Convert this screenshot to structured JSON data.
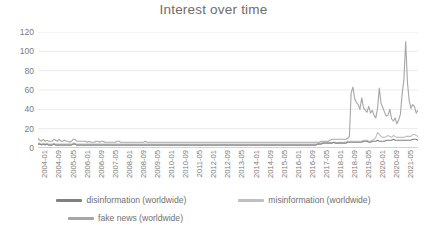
{
  "chart_data": {
    "type": "line",
    "title": "Interest over time",
    "xlabel": "",
    "ylabel": "",
    "ylim": [
      0,
      120
    ],
    "yticks": [
      0,
      20,
      40,
      60,
      80,
      100,
      120
    ],
    "grid": true,
    "legend_position": "bottom",
    "x_tick_labels": [
      "2004-01",
      "2004-09",
      "2005-05",
      "2006-01",
      "2006-09",
      "2007-05",
      "2008-01",
      "2008-09",
      "2009-05",
      "2010-01",
      "2010-09",
      "2011-05",
      "2012-01",
      "2012-09",
      "2013-05",
      "2014-01",
      "2014-09",
      "2015-05",
      "2016-01",
      "2016-09",
      "2017-05",
      "2018-01",
      "2018-09",
      "2019-05",
      "2020-01",
      "2020-09",
      "2021-05"
    ],
    "x_tick_step_months": 8,
    "x_start": "2004-01",
    "x_end": "2021-09",
    "n_points": 213,
    "series": [
      {
        "name": "disinformation (worldwide)",
        "color": "#808080",
        "values": [
          4,
          4,
          3,
          4,
          3,
          4,
          3,
          3,
          3,
          4,
          3,
          3,
          3,
          3,
          3,
          3,
          3,
          3,
          3,
          3,
          4,
          4,
          3,
          3,
          3,
          3,
          3,
          3,
          3,
          3,
          3,
          3,
          3,
          3,
          3,
          3,
          3,
          3,
          3,
          3,
          3,
          3,
          3,
          3,
          3,
          3,
          3,
          3,
          3,
          3,
          3,
          3,
          3,
          3,
          3,
          3,
          3,
          3,
          3,
          3,
          3,
          3,
          3,
          3,
          3,
          3,
          3,
          3,
          3,
          3,
          3,
          3,
          3,
          3,
          3,
          3,
          3,
          3,
          3,
          3,
          3,
          3,
          3,
          3,
          3,
          3,
          3,
          3,
          3,
          3,
          3,
          3,
          3,
          3,
          3,
          3,
          3,
          3,
          3,
          3,
          3,
          3,
          3,
          3,
          3,
          3,
          3,
          3,
          3,
          3,
          3,
          3,
          3,
          3,
          3,
          3,
          3,
          3,
          3,
          3,
          3,
          3,
          3,
          3,
          3,
          3,
          3,
          3,
          3,
          3,
          3,
          3,
          3,
          3,
          3,
          3,
          3,
          3,
          3,
          3,
          3,
          3,
          3,
          3,
          3,
          3,
          3,
          3,
          3,
          3,
          3,
          3,
          3,
          3,
          3,
          3,
          3,
          3,
          3,
          4,
          4,
          4,
          5,
          5,
          5,
          5,
          5,
          5,
          6,
          5,
          5,
          5,
          5,
          5,
          5,
          5,
          6,
          6,
          6,
          6,
          6,
          6,
          6,
          6,
          6,
          7,
          7,
          7,
          6,
          6,
          7,
          7,
          7,
          8,
          7,
          7,
          7,
          7,
          8,
          8,
          8,
          8,
          9,
          8,
          8,
          8,
          8,
          8,
          8,
          8,
          8,
          8,
          8,
          9,
          9,
          9,
          8
        ]
      },
      {
        "name": "misinformation (worldwide)",
        "color": "#bfbfbf",
        "values": [
          5,
          5,
          4,
          5,
          4,
          5,
          4,
          4,
          4,
          5,
          4,
          4,
          4,
          4,
          4,
          4,
          4,
          4,
          4,
          4,
          5,
          5,
          4,
          4,
          4,
          4,
          4,
          4,
          4,
          4,
          4,
          4,
          4,
          4,
          4,
          4,
          4,
          4,
          4,
          4,
          4,
          4,
          4,
          4,
          4,
          4,
          4,
          4,
          4,
          4,
          4,
          4,
          4,
          4,
          4,
          4,
          4,
          4,
          4,
          4,
          4,
          4,
          4,
          4,
          4,
          4,
          4,
          4,
          4,
          4,
          4,
          4,
          4,
          4,
          4,
          4,
          4,
          4,
          4,
          4,
          4,
          4,
          4,
          4,
          4,
          4,
          4,
          4,
          4,
          4,
          4,
          4,
          4,
          4,
          4,
          4,
          4,
          4,
          4,
          4,
          4,
          4,
          4,
          4,
          4,
          4,
          4,
          4,
          4,
          4,
          4,
          4,
          4,
          4,
          4,
          4,
          4,
          4,
          4,
          4,
          4,
          4,
          4,
          4,
          4,
          4,
          4,
          4,
          4,
          4,
          4,
          4,
          4,
          4,
          4,
          4,
          4,
          4,
          4,
          4,
          4,
          4,
          4,
          4,
          4,
          4,
          4,
          4,
          4,
          4,
          4,
          4,
          4,
          4,
          4,
          4,
          4,
          4,
          4,
          5,
          5,
          5,
          6,
          6,
          6,
          6,
          6,
          5,
          6,
          6,
          5,
          6,
          6,
          6,
          6,
          6,
          7,
          7,
          7,
          7,
          7,
          7,
          7,
          7,
          7,
          8,
          8,
          8,
          7,
          7,
          8,
          9,
          11,
          16,
          14,
          12,
          11,
          11,
          12,
          13,
          12,
          11,
          13,
          12,
          11,
          11,
          11,
          11,
          11,
          12,
          12,
          12,
          12,
          14,
          14,
          13,
          12
        ]
      },
      {
        "name": "fake news (worldwide)",
        "color": "#a6a6a6",
        "values": [
          10,
          8,
          7,
          9,
          7,
          8,
          7,
          7,
          7,
          9,
          8,
          7,
          9,
          7,
          7,
          8,
          7,
          7,
          6,
          7,
          9,
          9,
          7,
          7,
          7,
          7,
          7,
          7,
          6,
          7,
          6,
          6,
          6,
          7,
          7,
          6,
          7,
          7,
          6,
          6,
          6,
          6,
          6,
          6,
          6,
          7,
          7,
          6,
          6,
          6,
          6,
          6,
          6,
          6,
          6,
          6,
          6,
          6,
          6,
          6,
          6,
          7,
          6,
          6,
          6,
          6,
          6,
          6,
          6,
          6,
          6,
          6,
          6,
          6,
          6,
          6,
          6,
          6,
          6,
          6,
          6,
          6,
          6,
          6,
          6,
          6,
          6,
          6,
          6,
          6,
          6,
          6,
          6,
          6,
          6,
          6,
          6,
          6,
          6,
          6,
          6,
          6,
          6,
          6,
          6,
          6,
          6,
          6,
          6,
          6,
          6,
          6,
          6,
          6,
          6,
          6,
          6,
          6,
          6,
          6,
          6,
          6,
          6,
          6,
          6,
          6,
          6,
          6,
          6,
          6,
          6,
          6,
          6,
          6,
          6,
          6,
          6,
          6,
          6,
          6,
          6,
          6,
          6,
          6,
          6,
          6,
          6,
          6,
          6,
          6,
          6,
          6,
          6,
          6,
          6,
          6,
          6,
          6,
          6,
          6,
          6,
          7,
          7,
          7,
          7,
          7,
          8,
          9,
          9,
          9,
          9,
          9,
          9,
          9,
          9,
          9,
          10,
          12,
          57,
          63,
          51,
          47,
          45,
          40,
          52,
          42,
          39,
          37,
          43,
          36,
          39,
          34,
          31,
          41,
          62,
          46,
          42,
          37,
          33,
          34,
          40,
          30,
          28,
          31,
          25,
          29,
          35,
          56,
          71,
          110,
          68,
          49,
          41,
          45,
          43,
          36,
          39
        ]
      }
    ]
  },
  "legend": {
    "items": [
      {
        "label": "disinformation (worldwide)",
        "color": "#808080"
      },
      {
        "label": "misinformation (worldwide)",
        "color": "#bfbfbf"
      },
      {
        "label": "fake news (worldwide)",
        "color": "#a6a6a6"
      }
    ]
  }
}
